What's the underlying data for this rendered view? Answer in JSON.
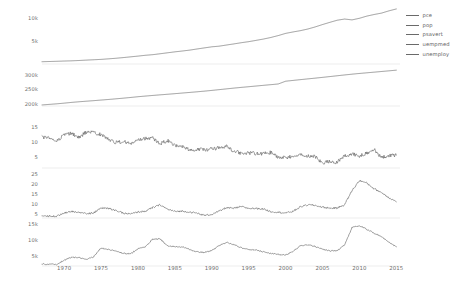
{
  "legend": {
    "position": "right",
    "entries": [
      {
        "label": "pce"
      },
      {
        "label": "pop"
      },
      {
        "label": "psavert"
      },
      {
        "label": "uempmed"
      },
      {
        "label": "unemploy"
      }
    ]
  },
  "xaxis": {
    "ticks": [
      "1970",
      "1975",
      "1980",
      "1985",
      "1990",
      "1995",
      "2000",
      "2005",
      "2010",
      "2015"
    ],
    "label": ""
  },
  "panels": [
    {
      "name": "pce",
      "yticks": [
        "10k",
        "5k"
      ]
    },
    {
      "name": "pop",
      "yticks": [
        "300k",
        "250k",
        "200k"
      ]
    },
    {
      "name": "psavert",
      "yticks": [
        "15",
        "10",
        "5"
      ]
    },
    {
      "name": "uempmed",
      "yticks": [
        "25",
        "20",
        "15",
        "10",
        "5"
      ]
    },
    {
      "name": "unemploy",
      "yticks": [
        "15k",
        "10k",
        "5k"
      ]
    }
  ],
  "chart_data": {
    "type": "line",
    "title": "",
    "xlabel": "",
    "ylabel": "",
    "grid": false,
    "legend_position": "right",
    "facet_layout": "vertical-5-panels",
    "xlim": [
      1967,
      2015.5
    ],
    "x": [
      1967,
      1968,
      1969,
      1970,
      1971,
      1972,
      1973,
      1974,
      1975,
      1976,
      1977,
      1978,
      1979,
      1980,
      1981,
      1982,
      1983,
      1984,
      1985,
      1986,
      1987,
      1988,
      1989,
      1990,
      1991,
      1992,
      1993,
      1994,
      1995,
      1996,
      1997,
      1998,
      1999,
      2000,
      2001,
      2002,
      2003,
      2004,
      2005,
      2006,
      2007,
      2008,
      2009,
      2010,
      2011,
      2012,
      2013,
      2014,
      2015
    ],
    "series": [
      {
        "name": "pce",
        "panel": "pce",
        "ylabel": "pce",
        "ylim": [
          0,
          12500
        ],
        "yticks": [
          5000,
          10000
        ],
        "ytick_labels": [
          "5k",
          "10k"
        ],
        "units": "billions of dollars",
        "values": [
          507,
          558,
          605,
          660,
          709,
          779,
          869,
          947,
          1030,
          1150,
          1278,
          1430,
          1596,
          1762,
          1944,
          2080,
          2287,
          2499,
          2713,
          2896,
          3097,
          3351,
          3594,
          3836,
          3980,
          4236,
          4484,
          4751,
          4987,
          5274,
          5570,
          5918,
          6342,
          6830,
          7149,
          7439,
          7804,
          8270,
          8803,
          9301,
          9773,
          10036,
          9846,
          10202,
          10689,
          11051,
          11361,
          11863,
          12284
        ]
      },
      {
        "name": "pop",
        "panel": "pop",
        "ylabel": "pop",
        "ylim": [
          195000,
          322000
        ],
        "yticks": [
          200000,
          250000,
          300000
        ],
        "ytick_labels": [
          "200k",
          "250k",
          "300k"
        ],
        "units": "thousands of persons",
        "values": [
          198712,
          200706,
          202677,
          205052,
          207661,
          209896,
          211909,
          213854,
          215973,
          218035,
          220239,
          222585,
          225055,
          227726,
          230008,
          232218,
          234333,
          236394,
          238506,
          240683,
          242843,
          245061,
          247387,
          249981,
          252677,
          255419,
          258137,
          260660,
          263034,
          265453,
          267901,
          270248,
          272691,
          282398,
          285225,
          287955,
          290626,
          293262,
          295993,
          298818,
          301696,
          304543,
          307240,
          309776,
          312047,
          314395,
          316739,
          319049,
          321362
        ]
      },
      {
        "name": "psavert",
        "panel": "psavert",
        "ylabel": "psavert",
        "ylim": [
          1.5,
          17.5
        ],
        "yticks": [
          5,
          10,
          15
        ],
        "ytick_labels": [
          "5",
          "10",
          "15"
        ],
        "units": "personal savings rate (percent)",
        "values": [
          11.7,
          11.5,
          10.5,
          12.6,
          13.0,
          11.6,
          13.5,
          13.3,
          12.6,
          11.2,
          10.0,
          10.3,
          9.6,
          10.6,
          11.3,
          11.5,
          9.5,
          10.7,
          9.0,
          8.7,
          7.4,
          7.8,
          7.6,
          7.8,
          8.2,
          8.7,
          7.2,
          6.4,
          6.4,
          6.4,
          6.3,
          6.7,
          5.0,
          5.0,
          5.4,
          5.9,
          5.4,
          5.3,
          3.2,
          3.7,
          3.5,
          5.4,
          6.1,
          5.6,
          6.5,
          7.6,
          5.0,
          5.7,
          5.8
        ]
      },
      {
        "name": "uempmed",
        "panel": "uempmed",
        "ylabel": "uempmed",
        "ylim": [
          3.5,
          26.5
        ],
        "yticks": [
          5,
          10,
          15,
          20,
          25
        ],
        "ytick_labels": [
          "5",
          "10",
          "15",
          "20",
          "25"
        ],
        "units": "median duration of unemployment (weeks)",
        "values": [
          4.5,
          4.5,
          4.4,
          6.0,
          6.8,
          6.3,
          5.7,
          6.0,
          8.5,
          8.3,
          7.2,
          5.9,
          5.5,
          6.5,
          6.9,
          8.7,
          10.1,
          7.9,
          6.8,
          6.9,
          6.5,
          5.9,
          4.8,
          5.3,
          6.9,
          8.7,
          8.3,
          9.2,
          8.3,
          8.3,
          8.0,
          6.7,
          6.4,
          6.0,
          6.8,
          9.1,
          10.1,
          9.8,
          8.9,
          8.4,
          8.5,
          10.2,
          17.2,
          22.2,
          21.0,
          18.1,
          16.2,
          13.7,
          11.6
        ]
      },
      {
        "name": "unemploy",
        "panel": "unemploy",
        "ylabel": "unemploy",
        "ylim": [
          2300,
          16000
        ],
        "yticks": [
          5000,
          10000,
          15000
        ],
        "ytick_labels": [
          "5k",
          "10k",
          "15k"
        ],
        "units": "number of unemployed (thousands)",
        "values": [
          2944,
          2798,
          2816,
          4093,
          5016,
          4882,
          4365,
          5156,
          7929,
          7406,
          6991,
          6202,
          6137,
          7637,
          8273,
          10678,
          10717,
          8539,
          8312,
          8237,
          7425,
          6701,
          6528,
          7047,
          8628,
          9613,
          8940,
          7996,
          7404,
          7236,
          6739,
          6210,
          5880,
          5692,
          6801,
          8620,
          8867,
          8370,
          7591,
          6992,
          7078,
          8924,
          14265,
          14825,
          13747,
          12506,
          11460,
          9617,
          8296
        ]
      }
    ]
  }
}
